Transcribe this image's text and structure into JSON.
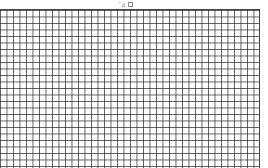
{
  "header": {
    "label": "˜д",
    "box_icon": "square-icon"
  },
  "grid": {
    "columns": 40,
    "rows": 24,
    "line_color": "#444444",
    "background": "#ffffff"
  }
}
